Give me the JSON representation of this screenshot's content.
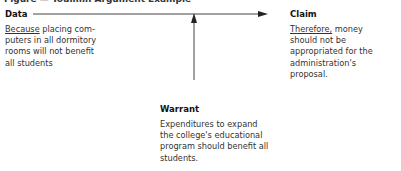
{
  "caption": "Figure — Toulmin Argument Example",
  "data": {
    "heading": "Data",
    "lead": "Because",
    "text": " placing com- puters in all dormitory rooms will not benefit all students"
  },
  "claim": {
    "heading": "Claim",
    "lead": "Therefore,",
    "text": " money should not be appropriated for the administration's proposal."
  },
  "warrant": {
    "heading": "Warrant",
    "text": "Expenditures to expand the college's educational program should benefit all students."
  },
  "colors": {
    "ink": "#231f20",
    "line": "#444444"
  }
}
